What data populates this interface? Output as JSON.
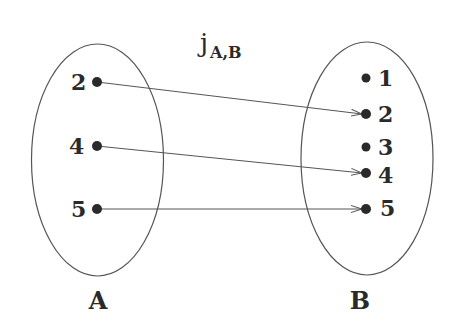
{
  "title": {
    "main": "j",
    "subscript": "A,B"
  },
  "sets": [
    {
      "name": "A",
      "label": "A",
      "elements": [
        "2",
        "4",
        "5"
      ]
    },
    {
      "name": "B",
      "label": "B",
      "elements": [
        "1",
        "2",
        "3",
        "4",
        "5"
      ]
    }
  ],
  "mappings": [
    {
      "from": "2",
      "to": "2"
    },
    {
      "from": "4",
      "to": "4"
    },
    {
      "from": "5",
      "to": "5"
    }
  ],
  "colors": {
    "stroke": "#555555",
    "dot": "#2a2a2a",
    "text": "#2a2a2a"
  }
}
